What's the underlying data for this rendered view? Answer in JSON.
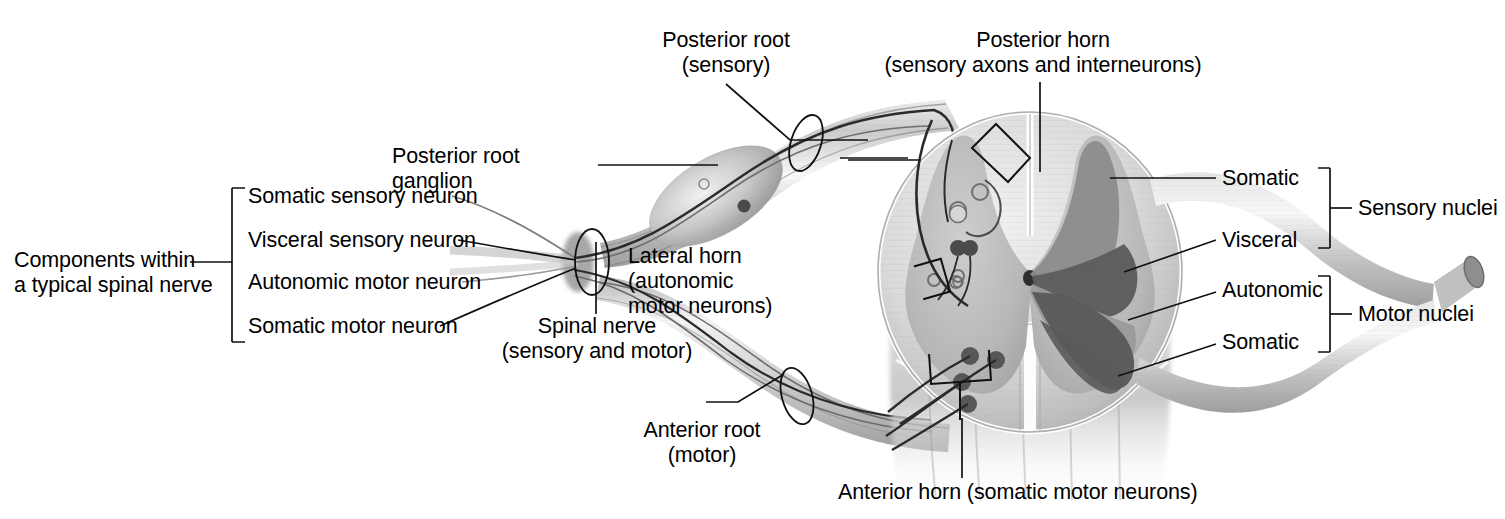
{
  "figure": {
    "domain": "anatomical-illustration",
    "background_color": "#ffffff",
    "ink_color": "#000000"
  },
  "palette": {
    "outline": "#1a1a1a",
    "leader_line": "#111111",
    "white_matter": "#d8d8d8",
    "gray_matter": "#b4b4b4",
    "gray_matter_core": "#c2c2c2",
    "nerve_light": "#d2d2d2",
    "nerve_mid": "#b0b0b0",
    "nerve_dark": "#8e8e8e",
    "nucleus_somatic_sensory": "#8d8d8d",
    "nucleus_visceral_sensory": "#5d5d5d",
    "nucleus_autonomic_motor": "#9a9a9a",
    "nucleus_somatic_motor": "#5a5a5a",
    "cord_body": "#c9c9c9",
    "ganglion": "#b8b8b8"
  },
  "left_bracket": {
    "name": "components-bracket",
    "title_line1": "Components within",
    "title_line2": "a typical spinal nerve",
    "items": [
      {
        "label": "Somatic sensory neuron"
      },
      {
        "label": "Visceral sensory neuron"
      },
      {
        "label": "Autonomic motor neuron"
      },
      {
        "label": "Somatic motor neuron"
      }
    ]
  },
  "labels": {
    "posterior_root_line1": "Posterior root",
    "posterior_root_line2": "(sensory)",
    "posterior_root_ganglion_line1": "Posterior root",
    "posterior_root_ganglion_line2": "ganglion",
    "posterior_horn_line1": "Posterior horn",
    "posterior_horn_line2": "(sensory axons and interneurons)",
    "lateral_horn_line1": "Lateral horn",
    "lateral_horn_line2": "(autonomic",
    "lateral_horn_line3": "motor neurons)",
    "spinal_nerve_line1": "Spinal nerve",
    "spinal_nerve_line2": "(sensory and motor)",
    "anterior_root_line1": "Anterior root",
    "anterior_root_line2": "(motor)",
    "anterior_horn": "Anterior horn (somatic motor neurons)"
  },
  "right_brackets": {
    "sensory": {
      "group_label": "Sensory nuclei",
      "items": [
        {
          "label": "Somatic"
        },
        {
          "label": "Visceral"
        }
      ]
    },
    "motor": {
      "group_label": "Motor nuclei",
      "items": [
        {
          "label": "Autonomic"
        },
        {
          "label": "Somatic"
        }
      ]
    }
  }
}
